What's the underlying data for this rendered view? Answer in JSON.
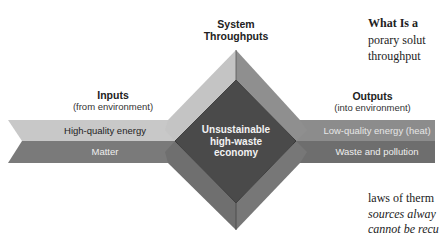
{
  "diagram": {
    "title_top": {
      "line1": "System",
      "line2": "Throughputs"
    },
    "inputs": {
      "heading": "Inputs",
      "subheading": "(from environment)",
      "bands": [
        {
          "label": "High-quality energy",
          "fill": "#c8c8c8",
          "text_color": "#1e1e1e"
        },
        {
          "label": "Matter",
          "fill": "#7a7a7a",
          "text_color": "#eeeeee"
        }
      ]
    },
    "outputs": {
      "heading": "Outputs",
      "subheading": "(into environment)",
      "bands": [
        {
          "label": "Low-quality energy (heat)",
          "fill": "#8c8c8c",
          "text_color": "#e6e6e6"
        },
        {
          "label": "Waste and pollution",
          "fill": "#6e6e6e",
          "text_color": "#eeeeee"
        }
      ]
    },
    "core": {
      "line1": "Unsustainable",
      "line2": "high-waste",
      "line3": "economy",
      "fill": "#4a4a4a"
    },
    "facet_colors": {
      "top_left": "#c4c4c4",
      "top_right": "#8f8f8f",
      "bottom_left": "#6f6f6f",
      "bottom_right": "#777777"
    }
  },
  "side_text": {
    "line1": "What Is a",
    "line2": "porary solut",
    "line3": "throughput",
    "line4": "laws of therm",
    "line5": "sources alway",
    "line6": "cannot be recu"
  }
}
